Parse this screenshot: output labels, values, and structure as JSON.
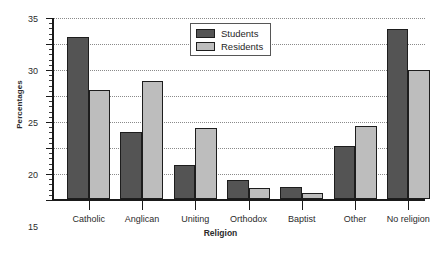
{
  "chart_data": {
    "type": "bar",
    "title": "",
    "xlabel": "Religion",
    "ylabel": "Percentages",
    "categories": [
      "Catholic",
      "Anglican",
      "Uniting",
      "Orthodox",
      "Baptist",
      "Other",
      "No religion"
    ],
    "series": [
      {
        "name": "Students",
        "color": "#545454",
        "values": [
          31.2,
          12.8,
          6.5,
          3.7,
          2.4,
          10.2,
          32.7
        ]
      },
      {
        "name": "Residents",
        "color": "#bdbdbd",
        "values": [
          21.0,
          22.6,
          13.6,
          2.2,
          1.1,
          14.1,
          24.9
        ]
      }
    ],
    "ylim": [
      0,
      35
    ],
    "ytick_labels": [
      "0",
      "5",
      "10",
      "15",
      "20",
      "25",
      "30",
      "35"
    ],
    "ytick_values": [
      0,
      5,
      10,
      15,
      20,
      25,
      30,
      35
    ],
    "yminor_step": 1,
    "grid": true,
    "legend_position": "top-center"
  }
}
